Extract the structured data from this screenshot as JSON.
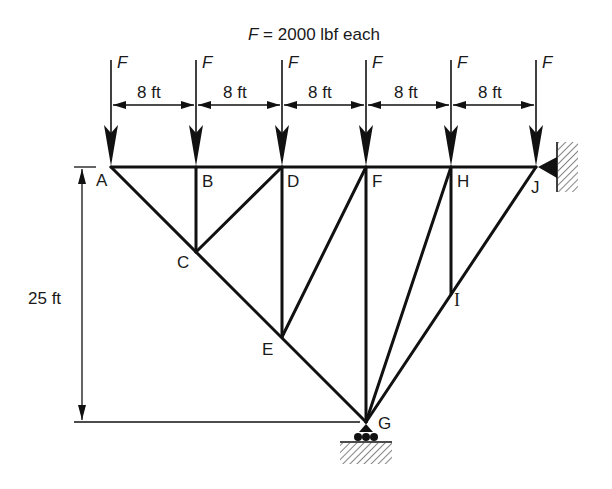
{
  "title": {
    "symbol": "F",
    "text": " = 2000 lbf each"
  },
  "loads": {
    "label": "F",
    "magnitude_lbf": 2000,
    "count": 6
  },
  "dimensions": {
    "spacing_label": "8 ft",
    "spacings": [
      "8 ft",
      "8 ft",
      "8 ft",
      "8 ft",
      "8 ft"
    ],
    "height_label": "25 ft"
  },
  "joints": {
    "A": "A",
    "B": "B",
    "C": "C",
    "D": "D",
    "E": "E",
    "F": "F",
    "G": "G",
    "H": "H",
    "I": "I",
    "J": "J"
  },
  "members": [
    [
      "A",
      "B"
    ],
    [
      "B",
      "D"
    ],
    [
      "D",
      "F"
    ],
    [
      "F",
      "H"
    ],
    [
      "H",
      "J"
    ],
    [
      "A",
      "C"
    ],
    [
      "C",
      "E"
    ],
    [
      "E",
      "G"
    ],
    [
      "G",
      "I"
    ],
    [
      "I",
      "J"
    ],
    [
      "B",
      "C"
    ],
    [
      "C",
      "D"
    ],
    [
      "D",
      "E"
    ],
    [
      "E",
      "F"
    ],
    [
      "F",
      "G"
    ],
    [
      "G",
      "H"
    ],
    [
      "H",
      "I"
    ]
  ],
  "supports": {
    "J": "pin (wall)",
    "G": "roller"
  }
}
